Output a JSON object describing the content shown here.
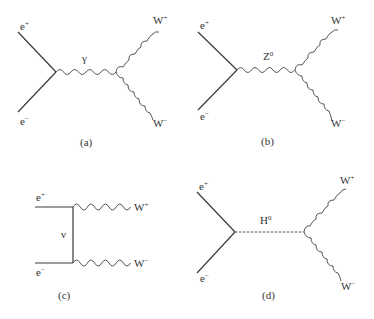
{
  "figure": {
    "panels": [
      {
        "id": "a",
        "caption": "(a)",
        "incoming": [
          {
            "particle": "e",
            "charge": "+"
          },
          {
            "particle": "e",
            "charge": "−"
          }
        ],
        "propagator": {
          "particle": "γ",
          "charge": "",
          "line": "wavy"
        },
        "outgoing": [
          {
            "particle": "W",
            "charge": "+"
          },
          {
            "particle": "W",
            "charge": "−"
          }
        ]
      },
      {
        "id": "b",
        "caption": "(b)",
        "incoming": [
          {
            "particle": "e",
            "charge": "+"
          },
          {
            "particle": "e",
            "charge": "−"
          }
        ],
        "propagator": {
          "particle": "Z",
          "charge": "0",
          "line": "wavy"
        },
        "outgoing": [
          {
            "particle": "W",
            "charge": "+"
          },
          {
            "particle": "W",
            "charge": "−"
          }
        ]
      },
      {
        "id": "c",
        "caption": "(c)",
        "incoming": [
          {
            "particle": "e",
            "charge": "+"
          },
          {
            "particle": "e",
            "charge": "−"
          }
        ],
        "propagator": {
          "particle": "ν",
          "charge": "",
          "line": "solid"
        },
        "outgoing": [
          {
            "particle": "W",
            "charge": "+"
          },
          {
            "particle": "W",
            "charge": "−"
          }
        ]
      },
      {
        "id": "d",
        "caption": "(d)",
        "incoming": [
          {
            "particle": "e",
            "charge": "+"
          },
          {
            "particle": "e",
            "charge": "−"
          }
        ],
        "propagator": {
          "particle": "H",
          "charge": "0",
          "line": "dashed"
        },
        "outgoing": [
          {
            "particle": "W",
            "charge": "+"
          },
          {
            "particle": "W",
            "charge": "−"
          }
        ]
      }
    ]
  }
}
